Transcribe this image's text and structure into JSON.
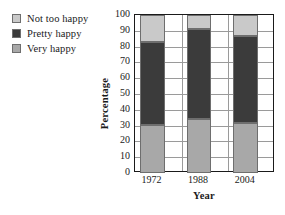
{
  "chart_data": {
    "type": "bar",
    "stacked": true,
    "title": "",
    "xlabel": "Year",
    "ylabel": "Percentage",
    "categories": [
      "1972",
      "1988",
      "2004"
    ],
    "ylim": [
      0,
      100
    ],
    "yticks": [
      0,
      10,
      20,
      30,
      40,
      50,
      60,
      70,
      80,
      90,
      100
    ],
    "grid": true,
    "legend_position": "top-left",
    "series": [
      {
        "name": "Very happy",
        "color": "#a8a8a8",
        "values": [
          30.5,
          34.0,
          31.5
        ]
      },
      {
        "name": "Pretty happy",
        "color": "#3b3b3b",
        "values": [
          52.5,
          57.0,
          55.0
        ]
      },
      {
        "name": "Not too happy",
        "color": "#c9c9c9",
        "values": [
          17.0,
          9.0,
          13.5
        ]
      }
    ],
    "segment_tops": {
      "1972": {
        "very_happy": 30.5,
        "pretty_happy": 83.0,
        "not_too_happy": 100
      },
      "1988": {
        "very_happy": 34.0,
        "pretty_happy": 91.0,
        "not_too_happy": 100
      },
      "2004": {
        "very_happy": 31.5,
        "pretty_happy": 86.5,
        "not_too_happy": 100
      }
    }
  },
  "legend": {
    "items": [
      {
        "label": "Not too happy",
        "color": "#c9c9c9"
      },
      {
        "label": "Pretty happy",
        "color": "#3b3b3b"
      },
      {
        "label": "Very happy",
        "color": "#a8a8a8"
      }
    ]
  },
  "axes": {
    "y_title": "Percentage",
    "x_title": "Year",
    "y_tick_labels": [
      "100",
      "90",
      "80",
      "70",
      "60",
      "50",
      "40",
      "30",
      "20",
      "10",
      "0"
    ],
    "x_tick_labels": [
      "1972",
      "1988",
      "2004"
    ]
  },
  "colors": {
    "frame": "#1a1a1a",
    "grid": "#9a9a9a",
    "background": "#ffffff",
    "segment_border": "#6e6e6e"
  }
}
